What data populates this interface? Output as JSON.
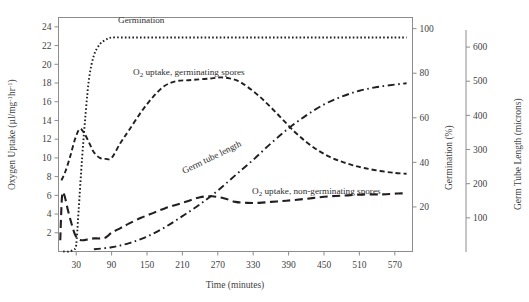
{
  "chart_data": {
    "type": "line",
    "title": "",
    "xlabel": "Time (minutes)",
    "ylabel": "Oxygen Uptake (µl/mg⁻¹hr⁻¹)",
    "y2label": "Germination (%)",
    "y3label": "Germ Tube Length (microns)",
    "xlim": [
      0,
      600
    ],
    "ylim": [
      0,
      25
    ],
    "y2lim": [
      0,
      105
    ],
    "y3lim": [
      0,
      650
    ],
    "grid": false,
    "legend_position": "inline-annotations",
    "xticks": [
      30,
      90,
      150,
      210,
      270,
      330,
      390,
      450,
      510,
      570
    ],
    "yticks": [
      2,
      4,
      6,
      8,
      10,
      12,
      14,
      16,
      18,
      20,
      22,
      24
    ],
    "y2ticks": [
      20,
      40,
      60,
      80,
      100
    ],
    "y3ticks": [
      100,
      200,
      300,
      400,
      500,
      600
    ],
    "series": [
      {
        "name": "Germination",
        "label": "Germination",
        "axis": "y2",
        "units": "%",
        "linestyle": "dotted",
        "color": "#231f20",
        "x": [
          8,
          18,
          26,
          30,
          34,
          40,
          46,
          52,
          60,
          70,
          80,
          90,
          120,
          150,
          180,
          210,
          240,
          270,
          300,
          330,
          360,
          390,
          420,
          450,
          480,
          510,
          540,
          570,
          590
        ],
        "values": [
          0,
          0,
          1,
          3,
          18,
          42,
          62,
          78,
          88,
          93,
          95,
          96,
          96,
          96,
          96,
          96,
          96,
          96,
          96,
          96,
          96,
          96,
          96,
          96,
          96,
          96,
          96,
          96,
          96
        ]
      },
      {
        "name": "O2 uptake, germinating spores",
        "label": "O₂ uptake, germinating spores",
        "axis": "y1",
        "units": "µl/mg⁻¹hr⁻¹",
        "linestyle": "dashed",
        "color": "#231f20",
        "x": [
          5,
          12,
          20,
          28,
          36,
          44,
          52,
          60,
          70,
          80,
          90,
          105,
          120,
          140,
          160,
          180,
          200,
          220,
          240,
          260,
          275,
          290,
          305,
          320,
          340,
          360,
          380,
          400,
          420,
          440,
          460,
          480,
          500,
          520,
          545,
          570,
          590
        ],
        "values": [
          7.6,
          8.6,
          10.2,
          12.0,
          13.1,
          12.6,
          11.6,
          10.6,
          10.0,
          9.9,
          10.0,
          11.6,
          13.0,
          14.9,
          16.5,
          17.7,
          18.2,
          18.3,
          18.4,
          18.5,
          18.6,
          18.5,
          18.2,
          17.6,
          16.6,
          15.4,
          14.1,
          12.8,
          11.7,
          10.8,
          10.1,
          9.6,
          9.2,
          8.9,
          8.6,
          8.4,
          8.3
        ]
      },
      {
        "name": "Germ tube length",
        "label": "Germ tube length",
        "axis": "y3",
        "units": "microns",
        "linestyle": "dashdot",
        "color": "#231f20",
        "x": [
          60,
          90,
          120,
          150,
          180,
          210,
          240,
          270,
          300,
          330,
          360,
          390,
          420,
          450,
          480,
          510,
          540,
          570,
          590
        ],
        "values": [
          8,
          14,
          26,
          45,
          72,
          105,
          140,
          180,
          225,
          270,
          318,
          362,
          400,
          432,
          455,
          472,
          483,
          490,
          494
        ]
      },
      {
        "name": "O2 uptake, non-germinating spores",
        "label": "O₂ uptake, non-germinating spores",
        "axis": "y1",
        "units": "µl/mg⁻¹hr⁻¹",
        "linestyle": "longdash",
        "color": "#231f20",
        "x": [
          3,
          6,
          10,
          16,
          22,
          28,
          34,
          42,
          50,
          60,
          70,
          80,
          90,
          105,
          120,
          140,
          160,
          180,
          200,
          220,
          240,
          260,
          280,
          300,
          320,
          340,
          360,
          380,
          400,
          430,
          460,
          490,
          520,
          550,
          575,
          590
        ],
        "values": [
          1.2,
          5.9,
          6.0,
          4.4,
          3.0,
          1.8,
          1.3,
          1.2,
          1.3,
          1.4,
          1.4,
          1.5,
          2.0,
          2.5,
          3.0,
          3.6,
          4.1,
          4.6,
          5.0,
          5.4,
          5.8,
          5.9,
          5.7,
          5.3,
          5.2,
          5.2,
          5.3,
          5.4,
          5.5,
          5.7,
          5.9,
          6.0,
          6.1,
          6.1,
          6.2,
          6.2
        ]
      }
    ],
    "annotations": [
      {
        "text": "Germination",
        "x": 30,
        "y": 19
      },
      {
        "text": "O₂ uptake, germinating spores",
        "x": 133,
        "y": 71
      },
      {
        "text": "Germ tube length",
        "x": 182,
        "y": 170
      },
      {
        "text": "O₂ uptake, non-germinating spores",
        "x": 252,
        "y": 190
      }
    ]
  },
  "axes": {
    "y1": {
      "title_parts": {
        "main": "Oxygen Uptake (µl/mg",
        "sup1": "-1",
        "mid": "hr",
        "sup2": "-1",
        "close": ")"
      },
      "ticks": [
        "24",
        "22",
        "20",
        "18",
        "16",
        "14",
        "12",
        "10",
        "8",
        "6",
        "4",
        "2"
      ]
    },
    "y2": {
      "title": "Germination (%)",
      "ticks": [
        "100",
        "80",
        "60",
        "40",
        "20"
      ]
    },
    "y3": {
      "title": "Germ Tube Length (microns)",
      "ticks": [
        "600",
        "500",
        "400",
        "300",
        "200",
        "100"
      ]
    },
    "x": {
      "title": "Time (minutes)",
      "ticks": [
        "30",
        "90",
        "150",
        "210",
        "270",
        "330",
        "390",
        "450",
        "510",
        "570"
      ]
    }
  },
  "labels": {
    "germination": "Germination",
    "o2_germinating": "uptake, germinating spores",
    "o2_germinating_prefix": "O",
    "o2_germinating_sub": "2",
    "germ_tube_length": "Germ tube length",
    "o2_non_germinating": "uptake, non-germinating spores",
    "o2_non_germinating_prefix": "O",
    "o2_non_germinating_sub": "2"
  }
}
